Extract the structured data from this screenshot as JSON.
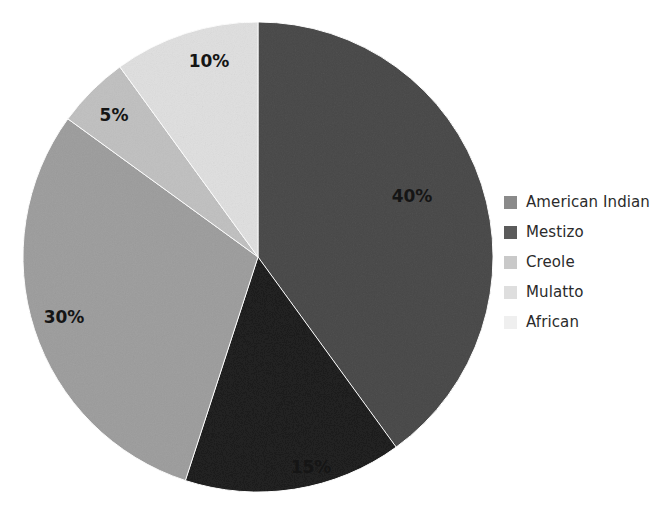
{
  "chart_data": {
    "type": "pie",
    "title": "",
    "subtitle": "",
    "xlabel": "",
    "ylabel": "",
    "grid": false,
    "legend_position": "right",
    "start_angle_deg": 0,
    "direction": "clockwise",
    "categories": [
      "American Indian",
      "Mestizo",
      "Creole",
      "Mulatto",
      "African"
    ],
    "values": [
      40,
      15,
      30,
      5,
      10
    ],
    "value_unit": "%",
    "data_labels": [
      "40%",
      "15%",
      "30%",
      "5%",
      "10%"
    ],
    "colors": [
      "#8a8a8a",
      "#5b5b5b",
      "#c9c9c9",
      "#dedede",
      "#efefef"
    ],
    "slices": [
      {
        "label": "American Indian",
        "value": 40,
        "data_label": "40%",
        "color": "#8a8a8a",
        "start_angle_deg": 0,
        "end_angle_deg": 144,
        "label_x": 412,
        "label_y": 197
      },
      {
        "label": "Mestizo",
        "value": 15,
        "data_label": "15%",
        "color": "#5b5b5b",
        "start_angle_deg": 144,
        "end_angle_deg": 198,
        "label_x": 311,
        "label_y": 468
      },
      {
        "label": "Creole",
        "value": 30,
        "data_label": "30%",
        "color": "#c9c9c9",
        "start_angle_deg": 198,
        "end_angle_deg": 306,
        "label_x": 64,
        "label_y": 318
      },
      {
        "label": "Mulatto",
        "value": 5,
        "data_label": "5%",
        "color": "#dedede",
        "start_angle_deg": 306,
        "end_angle_deg": 324,
        "label_x": 114,
        "label_y": 116
      },
      {
        "label": "African",
        "value": 10,
        "data_label": "10%",
        "color": "#efefef",
        "start_angle_deg": 324,
        "end_angle_deg": 360,
        "label_x": 209,
        "label_y": 62
      }
    ],
    "geometry": {
      "center_x": 258,
      "center_y": 257,
      "radius": 235
    }
  },
  "legend": {
    "items": [
      {
        "label": "American Indian",
        "color": "#8a8a8a"
      },
      {
        "label": "Mestizo",
        "color": "#5b5b5b"
      },
      {
        "label": "Creole",
        "color": "#c9c9c9"
      },
      {
        "label": "Mulatto",
        "color": "#dedede"
      },
      {
        "label": "African",
        "color": "#efefef"
      }
    ]
  }
}
